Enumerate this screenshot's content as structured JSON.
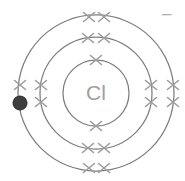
{
  "diagram": {
    "type": "bohr-model-ion",
    "element_symbol": "Cl",
    "ion_charge": "–",
    "center": {
      "x": 96,
      "y": 93
    },
    "colors": {
      "background": "#ffffff",
      "ring": "#7e7e7e",
      "electron_x": "#9c9c9c",
      "gained_electron": "#3e3e3e",
      "symbol_text": "#9e9e9e",
      "charge_text": "#adadad"
    },
    "symbol_font_size": 21,
    "charge_font_size": 17,
    "shells": [
      {
        "name": "shell-1",
        "radius": 33,
        "electron_count": 2,
        "electrons": [
          {
            "type": "x",
            "x": 96,
            "y": 60
          },
          {
            "type": "x",
            "x": 96,
            "y": 126
          }
        ]
      },
      {
        "name": "shell-2",
        "radius": 56,
        "electron_count": 8,
        "electrons": [
          {
            "type": "x",
            "x": 88,
            "y": 38
          },
          {
            "type": "x",
            "x": 104,
            "y": 38
          },
          {
            "type": "x",
            "x": 88,
            "y": 148
          },
          {
            "type": "x",
            "x": 104,
            "y": 148
          },
          {
            "type": "x",
            "x": 41,
            "y": 85
          },
          {
            "type": "x",
            "x": 41,
            "y": 102
          },
          {
            "type": "x",
            "x": 151,
            "y": 85
          },
          {
            "type": "x",
            "x": 151,
            "y": 102
          }
        ]
      },
      {
        "name": "shell-3",
        "radius": 78,
        "electron_count": 8,
        "electrons": [
          {
            "type": "x",
            "x": 89,
            "y": 17
          },
          {
            "type": "x",
            "x": 104,
            "y": 17
          },
          {
            "type": "x",
            "x": 89,
            "y": 168
          },
          {
            "type": "x",
            "x": 104,
            "y": 168
          },
          {
            "type": "x",
            "x": 173,
            "y": 85
          },
          {
            "type": "x",
            "x": 173,
            "y": 102
          },
          {
            "type": "x",
            "x": 20,
            "y": 85
          },
          {
            "type": "dot",
            "x": 20,
            "y": 103,
            "radius": 7
          }
        ]
      }
    ]
  }
}
